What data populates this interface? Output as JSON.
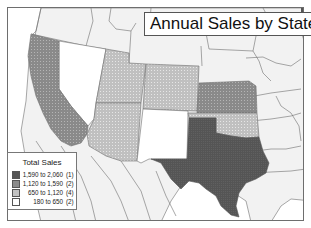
{
  "title": "Annual Sales by State",
  "legend": {
    "title": "Total Sales",
    "items": [
      {
        "range": "1,590 to 2,060",
        "count": "(1)",
        "color": "#555555"
      },
      {
        "range": "1,120 to 1,590",
        "count": "(2)",
        "color": "#8a8a8a"
      },
      {
        "range": "650 to 1,120",
        "count": "(4)",
        "color": "#c2c2c2"
      },
      {
        "range": "180 to 650",
        "count": "(2)",
        "color": "#ffffff"
      }
    ]
  },
  "colors": {
    "background_region": "#f2f2f2",
    "ocean": "#ffffff",
    "border": "#6e6e6e",
    "class_1": "#555555",
    "class_2": "#8a8a8a",
    "class_3": "#c2c2c2",
    "class_4": "#ffffff"
  },
  "states": [
    {
      "name": "Texas",
      "class": "1,590 to 2,060"
    },
    {
      "name": "California",
      "class": "1,120 to 1,590"
    },
    {
      "name": "Kansas",
      "class": "1,120 to 1,590"
    },
    {
      "name": "Utah",
      "class": "650 to 1,120"
    },
    {
      "name": "Colorado",
      "class": "650 to 1,120"
    },
    {
      "name": "Arizona",
      "class": "650 to 1,120"
    },
    {
      "name": "Oklahoma",
      "class": "650 to 1,120"
    },
    {
      "name": "Nevada",
      "class": "180 to 650"
    },
    {
      "name": "New Mexico",
      "class": "180 to 650"
    }
  ]
}
